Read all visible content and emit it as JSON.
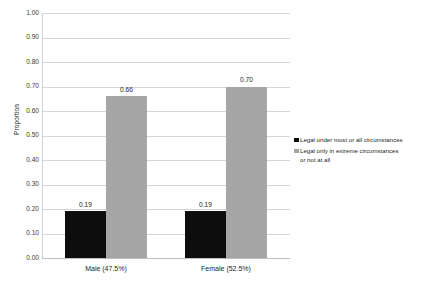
{
  "chart_data": {
    "type": "bar",
    "title": "",
    "xlabel": "",
    "ylabel": "Proportion",
    "ylim": [
      0,
      1.0
    ],
    "ytick_step": 0.1,
    "ytick_labels": [
      "1.00",
      "0.90",
      "0.80",
      "0.70",
      "0.60",
      "0.50",
      "0.40",
      "0.30",
      "0.20",
      "0.10",
      "0.00"
    ],
    "grid": true,
    "legend_position": "right",
    "categories": [
      "Male (47.5%)",
      "Female (52.5%)"
    ],
    "series": [
      {
        "name": "Legal under most or all circumstances",
        "color": "#0d0d0d",
        "values": [
          0.19,
          0.19
        ],
        "labels": [
          "0.19",
          "0.19"
        ]
      },
      {
        "name": "Legal only in extreme circumstances\nor not at all",
        "color": "#a6a6a6",
        "values": [
          0.66,
          0.7
        ],
        "labels": [
          "0.66",
          "0.70"
        ]
      }
    ]
  },
  "colors": {
    "series_0": "#0d0d0d",
    "series_1": "#a6a6a6",
    "gridline": "#d6d6d6",
    "text": "#231f20",
    "background": "#ffffff"
  }
}
